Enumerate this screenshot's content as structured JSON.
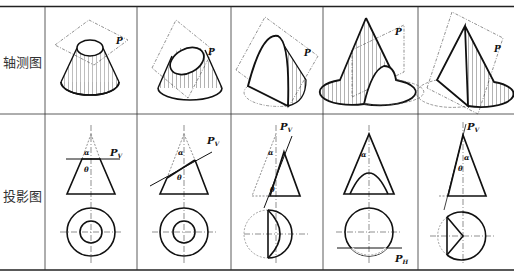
{
  "table": {
    "rows": [
      {
        "label": "轴测图"
      },
      {
        "label": "投影图"
      }
    ],
    "columns": [
      {
        "axo_label": "P",
        "proj_labels": {
          "plane": "Pv",
          "plane_main": "P",
          "plane_sub": "V",
          "alpha": "α",
          "theta": "θ"
        },
        "section": "circle"
      },
      {
        "axo_label": "P",
        "proj_labels": {
          "plane": "Pv",
          "plane_main": "P",
          "plane_sub": "V",
          "alpha": "α",
          "theta": "θ"
        },
        "section": "ellipse"
      },
      {
        "axo_label": "P",
        "proj_labels": {
          "plane": "Pv",
          "plane_main": "P",
          "plane_sub": "V",
          "alpha": "α",
          "theta": "θ"
        },
        "section": "parabola"
      },
      {
        "axo_label": "P",
        "proj_labels": {
          "plane": "PH",
          "plane_main": "P",
          "plane_sub": "H",
          "alpha": "α"
        },
        "section": "hyperbola"
      },
      {
        "axo_label": "P",
        "proj_labels": {
          "plane": "Pv",
          "plane_main": "P",
          "plane_sub": "V",
          "alpha": "α",
          "theta": "θ"
        },
        "section": "triangle"
      }
    ]
  }
}
